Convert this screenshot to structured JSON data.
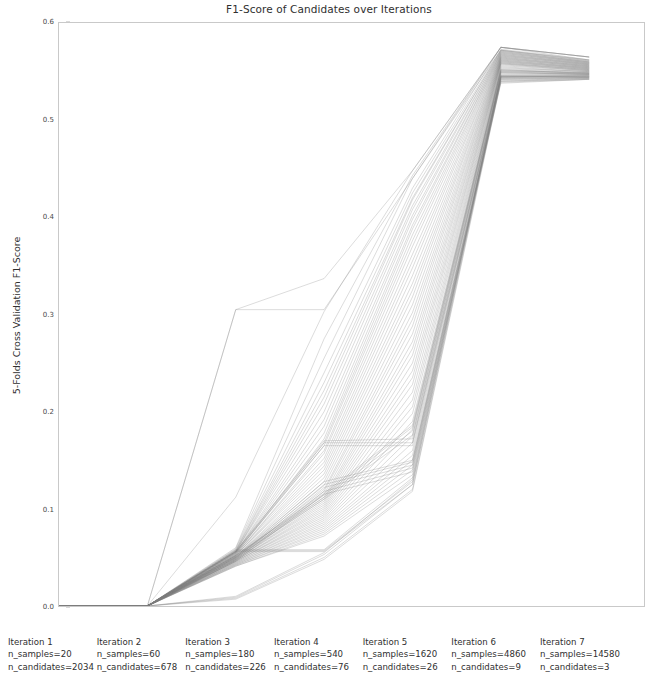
{
  "chart_data": {
    "type": "line",
    "title": "F1-Score of Candidates over Iterations",
    "xlabel": "",
    "ylabel": "5-Folds Cross Validation F1-Score",
    "ylim": [
      0.0,
      0.6
    ],
    "yticks": [
      "0.0",
      "0.1",
      "0.2",
      "0.3",
      "0.4",
      "0.5",
      "0.6"
    ],
    "ytick_values": [
      0.0,
      0.1,
      0.2,
      0.3,
      0.4,
      0.5,
      0.6
    ],
    "grid": false,
    "legend": "none",
    "line_color": "#808080",
    "line_alpha": 0.35,
    "x": [
      1,
      2,
      3,
      4,
      5,
      6,
      7
    ],
    "xtick_labels": [
      "Iteration 1\nn_samples=20\nn_candidates=2034",
      "Iteration 2\nn_samples=60\nn_candidates=678",
      "Iteration 3\nn_samples=180\nn_candidates=226",
      "Iteration 4\nn_samples=540\nn_candidates=76",
      "Iteration 5\nn_samples=1620\nn_candidates=26",
      "Iteration 6\nn_samples=4860\nn_candidates=9",
      "Iteration 7\nn_samples=14580\nn_candidates=3"
    ],
    "iterations": [
      {
        "index": 1,
        "label": "Iteration 1",
        "n_samples": "20",
        "n_candidates": "2034"
      },
      {
        "index": 2,
        "label": "Iteration 2",
        "n_samples": "60",
        "n_candidates": "678"
      },
      {
        "index": 3,
        "label": "Iteration 3",
        "n_samples": "180",
        "n_candidates": "226"
      },
      {
        "index": 4,
        "label": "Iteration 4",
        "n_samples": "540",
        "n_candidates": "76"
      },
      {
        "index": 5,
        "label": "Iteration 5",
        "n_samples": "1620",
        "n_candidates": "26"
      },
      {
        "index": 6,
        "label": "Iteration 6",
        "n_samples": "4860",
        "n_candidates": "9"
      },
      {
        "index": 7,
        "label": "Iteration 7",
        "n_samples": "14580",
        "n_candidates": "3"
      }
    ],
    "series": [
      {
        "name": "candidate-01",
        "values": [
          0.0,
          0.0,
          0.305,
          0.337,
          0.448,
          0.575,
          0.565
        ]
      },
      {
        "name": "candidate-02",
        "values": [
          0.0,
          0.0,
          0.112,
          0.303,
          0.448,
          0.575,
          0.565
        ]
      },
      {
        "name": "candidate-03",
        "values": [
          0.0,
          0.0,
          0.06,
          0.275,
          0.443,
          0.575,
          0.565
        ]
      },
      {
        "name": "candidate-04",
        "values": [
          0.0,
          0.0,
          0.059,
          0.255,
          0.44,
          0.575,
          0.565
        ]
      },
      {
        "name": "candidate-05",
        "values": [
          0.0,
          0.0,
          0.058,
          0.24,
          0.43,
          0.575,
          0.562
        ]
      },
      {
        "name": "candidate-06",
        "values": [
          0.0,
          0.0,
          0.057,
          0.23,
          0.425,
          0.573,
          0.562
        ]
      },
      {
        "name": "candidate-07",
        "values": [
          0.0,
          0.0,
          0.057,
          0.222,
          0.42,
          0.572,
          0.561
        ]
      },
      {
        "name": "candidate-08",
        "values": [
          0.0,
          0.0,
          0.056,
          0.215,
          0.418,
          0.572,
          0.561
        ]
      },
      {
        "name": "candidate-09",
        "values": [
          0.0,
          0.0,
          0.056,
          0.208,
          0.412,
          0.571,
          0.56
        ]
      },
      {
        "name": "candidate-10",
        "values": [
          0.0,
          0.0,
          0.056,
          0.2,
          0.408,
          0.571,
          0.56
        ]
      },
      {
        "name": "candidate-11",
        "values": [
          0.0,
          0.0,
          0.055,
          0.192,
          0.402,
          0.57,
          0.56
        ]
      },
      {
        "name": "candidate-12",
        "values": [
          0.0,
          0.0,
          0.055,
          0.185,
          0.398,
          0.57,
          0.559
        ]
      },
      {
        "name": "candidate-13",
        "values": [
          0.0,
          0.0,
          0.055,
          0.178,
          0.392,
          0.569,
          0.559
        ]
      },
      {
        "name": "candidate-14",
        "values": [
          0.0,
          0.0,
          0.054,
          0.172,
          0.388,
          0.569,
          0.559
        ]
      },
      {
        "name": "candidate-15",
        "values": [
          0.0,
          0.0,
          0.054,
          0.168,
          0.382,
          0.568,
          0.558
        ]
      },
      {
        "name": "candidate-16",
        "values": [
          0.0,
          0.0,
          0.054,
          0.165,
          0.376,
          0.568,
          0.558
        ]
      },
      {
        "name": "candidate-17",
        "values": [
          0.0,
          0.0,
          0.053,
          0.16,
          0.37,
          0.567,
          0.558
        ]
      },
      {
        "name": "candidate-18",
        "values": [
          0.0,
          0.0,
          0.053,
          0.157,
          0.362,
          0.567,
          0.557
        ]
      },
      {
        "name": "candidate-19",
        "values": [
          0.0,
          0.0,
          0.053,
          0.152,
          0.355,
          0.566,
          0.557
        ]
      },
      {
        "name": "candidate-20",
        "values": [
          0.0,
          0.0,
          0.052,
          0.148,
          0.348,
          0.566,
          0.557
        ]
      },
      {
        "name": "candidate-21",
        "values": [
          0.0,
          0.0,
          0.052,
          0.144,
          0.34,
          0.565,
          0.556
        ]
      },
      {
        "name": "candidate-22",
        "values": [
          0.0,
          0.0,
          0.052,
          0.14,
          0.332,
          0.565,
          0.556
        ]
      },
      {
        "name": "candidate-23",
        "values": [
          0.0,
          0.0,
          0.051,
          0.136,
          0.325,
          0.564,
          0.556
        ]
      },
      {
        "name": "candidate-24",
        "values": [
          0.0,
          0.0,
          0.051,
          0.132,
          0.318,
          0.564,
          0.555
        ]
      },
      {
        "name": "candidate-25",
        "values": [
          0.0,
          0.0,
          0.051,
          0.128,
          0.31,
          0.563,
          0.555
        ]
      },
      {
        "name": "candidate-26",
        "values": [
          0.0,
          0.0,
          0.05,
          0.124,
          0.302,
          0.563,
          0.555
        ]
      },
      {
        "name": "candidate-27",
        "values": [
          0.0,
          0.0,
          0.05,
          0.12,
          0.295,
          0.562,
          0.554
        ]
      },
      {
        "name": "candidate-28",
        "values": [
          0.0,
          0.0,
          0.05,
          0.118,
          0.288,
          0.562,
          0.554
        ]
      },
      {
        "name": "candidate-29",
        "values": [
          0.0,
          0.0,
          0.049,
          0.115,
          0.28,
          0.561,
          0.554
        ]
      },
      {
        "name": "candidate-30",
        "values": [
          0.0,
          0.0,
          0.049,
          0.112,
          0.272,
          0.561,
          0.553
        ]
      },
      {
        "name": "candidate-31",
        "values": [
          0.0,
          0.0,
          0.049,
          0.11,
          0.265,
          0.56,
          0.553
        ]
      },
      {
        "name": "candidate-32",
        "values": [
          0.0,
          0.0,
          0.048,
          0.108,
          0.258,
          0.56,
          0.553
        ]
      },
      {
        "name": "candidate-33",
        "values": [
          0.0,
          0.0,
          0.048,
          0.106,
          0.25,
          0.559,
          0.552
        ]
      },
      {
        "name": "candidate-34",
        "values": [
          0.0,
          0.0,
          0.048,
          0.104,
          0.242,
          0.559,
          0.552
        ]
      },
      {
        "name": "candidate-35",
        "values": [
          0.0,
          0.0,
          0.047,
          0.102,
          0.235,
          0.558,
          0.552
        ]
      },
      {
        "name": "candidate-36",
        "values": [
          0.0,
          0.0,
          0.047,
          0.1,
          0.228,
          0.558,
          0.551
        ]
      },
      {
        "name": "candidate-37",
        "values": [
          0.0,
          0.0,
          0.047,
          0.098,
          0.22,
          0.557,
          0.551
        ]
      },
      {
        "name": "candidate-38",
        "values": [
          0.0,
          0.0,
          0.046,
          0.096,
          0.212,
          0.556,
          0.551
        ]
      },
      {
        "name": "candidate-39",
        "values": [
          0.0,
          0.0,
          0.046,
          0.094,
          0.205,
          0.555,
          0.55
        ]
      },
      {
        "name": "candidate-40",
        "values": [
          0.0,
          0.0,
          0.046,
          0.092,
          0.198,
          0.554,
          0.55
        ]
      },
      {
        "name": "candidate-41",
        "values": [
          0.0,
          0.0,
          0.045,
          0.09,
          0.19,
          0.553,
          0.55
        ]
      },
      {
        "name": "candidate-42",
        "values": [
          0.0,
          0.0,
          0.045,
          0.088,
          0.182,
          0.552,
          0.549
        ]
      },
      {
        "name": "candidate-43",
        "values": [
          0.0,
          0.0,
          0.044,
          0.086,
          0.175,
          0.551,
          0.549
        ]
      },
      {
        "name": "candidate-44",
        "values": [
          0.0,
          0.0,
          0.044,
          0.084,
          0.168,
          0.55,
          0.549
        ]
      },
      {
        "name": "candidate-45",
        "values": [
          0.0,
          0.0,
          0.043,
          0.082,
          0.16,
          0.549,
          0.548
        ]
      },
      {
        "name": "candidate-46",
        "values": [
          0.0,
          0.0,
          0.043,
          0.08,
          0.155,
          0.548,
          0.548
        ]
      },
      {
        "name": "candidate-47",
        "values": [
          0.0,
          0.0,
          0.042,
          0.078,
          0.15,
          0.547,
          0.547
        ]
      },
      {
        "name": "candidate-48",
        "values": [
          0.0,
          0.0,
          0.042,
          0.076,
          0.145,
          0.546,
          0.547
        ]
      },
      {
        "name": "candidate-49",
        "values": [
          0.0,
          0.0,
          0.041,
          0.074,
          0.14,
          0.545,
          0.546
        ]
      },
      {
        "name": "candidate-50",
        "values": [
          0.0,
          0.0,
          0.041,
          0.072,
          0.135,
          0.544,
          0.546
        ]
      },
      {
        "name": "candidate-51",
        "values": [
          0.0,
          0.0,
          0.056,
          0.17,
          0.172,
          0.545,
          0.545
        ]
      },
      {
        "name": "candidate-52",
        "values": [
          0.0,
          0.0,
          0.056,
          0.168,
          0.168,
          0.544,
          0.545
        ]
      },
      {
        "name": "candidate-53",
        "values": [
          0.0,
          0.0,
          0.055,
          0.165,
          0.165,
          0.543,
          0.544
        ]
      },
      {
        "name": "candidate-54",
        "values": [
          0.0,
          0.0,
          0.05,
          0.128,
          0.15,
          0.542,
          0.544
        ]
      },
      {
        "name": "candidate-55",
        "values": [
          0.0,
          0.0,
          0.049,
          0.125,
          0.148,
          0.541,
          0.543
        ]
      },
      {
        "name": "candidate-56",
        "values": [
          0.0,
          0.0,
          0.048,
          0.122,
          0.145,
          0.54,
          0.543
        ]
      },
      {
        "name": "candidate-57",
        "values": [
          0.0,
          0.0,
          0.047,
          0.118,
          0.142,
          0.539,
          0.542
        ]
      },
      {
        "name": "candidate-58",
        "values": [
          0.0,
          0.0,
          0.046,
          0.115,
          0.138,
          0.538,
          0.542
        ]
      },
      {
        "name": "candidate-59",
        "values": [
          0.0,
          0.0,
          0.052,
          0.116,
          0.186,
          0.552,
          0.548
        ]
      },
      {
        "name": "candidate-60",
        "values": [
          0.0,
          0.0,
          0.052,
          0.114,
          0.184,
          0.551,
          0.548
        ]
      },
      {
        "name": "candidate-61",
        "values": [
          0.0,
          0.0,
          0.051,
          0.112,
          0.18,
          0.55,
          0.547
        ]
      },
      {
        "name": "candidate-62",
        "values": [
          0.0,
          0.0,
          0.05,
          0.11,
          0.176,
          0.549,
          0.547
        ]
      },
      {
        "name": "candidate-63",
        "values": [
          0.0,
          0.0,
          0.01,
          0.055,
          0.13,
          0.545,
          0.545
        ]
      },
      {
        "name": "candidate-64",
        "values": [
          0.0,
          0.0,
          0.009,
          0.053,
          0.125,
          0.543,
          0.544
        ]
      },
      {
        "name": "candidate-65",
        "values": [
          0.0,
          0.0,
          0.008,
          0.05,
          0.12,
          0.542,
          0.543
        ]
      },
      {
        "name": "candidate-66",
        "values": [
          0.0,
          0.0,
          0.007,
          0.048,
          0.118,
          0.54,
          0.542
        ]
      },
      {
        "name": "candidate-67",
        "values": [
          0.0,
          0.0,
          0.058,
          0.058,
          0.132,
          0.546,
          0.546
        ]
      },
      {
        "name": "candidate-68",
        "values": [
          0.0,
          0.0,
          0.057,
          0.057,
          0.128,
          0.545,
          0.545
        ]
      },
      {
        "name": "candidate-69",
        "values": [
          0.0,
          0.0,
          0.056,
          0.056,
          0.125,
          0.544,
          0.544
        ]
      },
      {
        "name": "candidate-70",
        "values": [
          0.0,
          0.0,
          0.305,
          0.305,
          0.44,
          0.572,
          0.562
        ]
      }
    ]
  }
}
